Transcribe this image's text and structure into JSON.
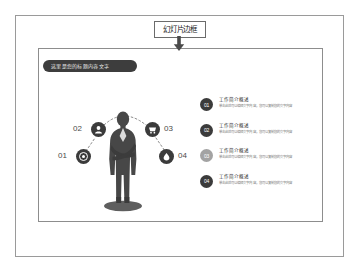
{
  "annotation": {
    "label": "幻灯片边框",
    "arrow_icon": "down-arrow-icon"
  },
  "slide": {
    "title": "这里是您的标题内容文字",
    "diagram": {
      "center_figure_icon": "businessman-silhouette-icon",
      "connector_style": "dotted-arc",
      "nodes": [
        {
          "number": "01",
          "icon": "target-icon",
          "tone": "dark",
          "position": "left-lower"
        },
        {
          "number": "02",
          "icon": "user-icon",
          "tone": "dark",
          "position": "left-upper"
        },
        {
          "number": "03",
          "icon": "cart-icon",
          "tone": "dark",
          "position": "right-upper"
        },
        {
          "number": "04",
          "icon": "droplet-icon",
          "tone": "dark",
          "position": "right-lower"
        }
      ]
    },
    "list": {
      "items": [
        {
          "number": "01",
          "tone": "dark",
          "title": "工作简介概述",
          "desc": "单击此处可以编辑文字内容，您可以复制您的文字内容"
        },
        {
          "number": "02",
          "tone": "dark",
          "title": "工作简介概述",
          "desc": "单击此处可以编辑文字内容，您可以复制您的文字内容"
        },
        {
          "number": "03",
          "tone": "light",
          "title": "工作简介概述",
          "desc": "单击此处可以编辑文字内容，您可以复制您的文字内容"
        },
        {
          "number": "04",
          "tone": "dark",
          "title": "工作简介概述",
          "desc": "单击此处可以编辑文字内容，您可以复制您的文字内容"
        }
      ]
    }
  },
  "colors": {
    "dark_badge": "#3b3b3b",
    "light_badge": "#a3a3a3",
    "title_pill": "#3d3d3d",
    "border": "#9a9a9a",
    "page_bg": "#ffffff"
  }
}
